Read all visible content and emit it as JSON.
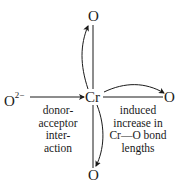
{
  "diagram": {
    "center_atom": "Cr",
    "donor": {
      "symbol": "O",
      "charge": "2−"
    },
    "ligands": {
      "top": "O",
      "right": "O",
      "bottom": "O"
    },
    "left_caption": [
      "donor-",
      "acceptor",
      "inter-",
      "action"
    ],
    "right_caption": [
      "induced",
      "increase in",
      "Cr—O bond",
      "lengths"
    ],
    "colors": {
      "ink": "#1a1a1a",
      "background": "#ffffff"
    }
  }
}
